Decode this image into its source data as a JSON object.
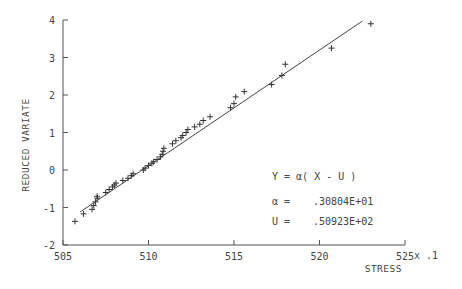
{
  "chart_data": {
    "type": "scatter",
    "title": "",
    "xlabel": "STRESS",
    "xlabel_suffix": "x .1",
    "ylabel": "REDUCED VARIATE",
    "xlim": [
      505,
      525
    ],
    "ylim": [
      -2,
      4
    ],
    "x_ticks": [
      505,
      510,
      515,
      520,
      525
    ],
    "x_tick_labels": [
      "505",
      "510",
      "515",
      "520",
      "525"
    ],
    "y_ticks": [
      -2,
      -1,
      0,
      1,
      2,
      3,
      4
    ],
    "y_tick_labels": [
      "-2",
      "-1",
      "0",
      "1",
      "2",
      "3",
      "4"
    ],
    "grid": false,
    "marker": "+",
    "series": [
      {
        "name": "observations",
        "points": [
          [
            505.7,
            -1.37
          ],
          [
            506.2,
            -1.17
          ],
          [
            506.7,
            -1.05
          ],
          [
            506.8,
            -0.95
          ],
          [
            506.9,
            -0.85
          ],
          [
            507.0,
            -0.75
          ],
          [
            507.0,
            -0.7
          ],
          [
            507.5,
            -0.6
          ],
          [
            507.7,
            -0.52
          ],
          [
            507.9,
            -0.45
          ],
          [
            508.0,
            -0.4
          ],
          [
            508.1,
            -0.35
          ],
          [
            508.5,
            -0.28
          ],
          [
            508.8,
            -0.22
          ],
          [
            509.0,
            -0.15
          ],
          [
            509.1,
            -0.1
          ],
          [
            509.7,
            0.0
          ],
          [
            509.8,
            0.05
          ],
          [
            510.0,
            0.12
          ],
          [
            510.2,
            0.18
          ],
          [
            510.3,
            0.22
          ],
          [
            510.5,
            0.28
          ],
          [
            510.7,
            0.35
          ],
          [
            510.8,
            0.42
          ],
          [
            510.85,
            0.5
          ],
          [
            510.9,
            0.58
          ],
          [
            511.4,
            0.7
          ],
          [
            511.6,
            0.78
          ],
          [
            511.9,
            0.86
          ],
          [
            512.0,
            0.92
          ],
          [
            512.2,
            1.0
          ],
          [
            512.3,
            1.08
          ],
          [
            512.7,
            1.15
          ],
          [
            513.0,
            1.22
          ],
          [
            513.2,
            1.32
          ],
          [
            513.6,
            1.42
          ],
          [
            514.8,
            1.66
          ],
          [
            515.0,
            1.77
          ],
          [
            515.1,
            1.95
          ],
          [
            515.6,
            2.09
          ],
          [
            517.2,
            2.28
          ],
          [
            517.8,
            2.52
          ],
          [
            518.0,
            2.82
          ],
          [
            520.7,
            3.25
          ],
          [
            523.0,
            3.9
          ]
        ]
      }
    ],
    "fit_line": {
      "name": "Y = a(X - U)",
      "x": [
        506.0,
        522.5
      ],
      "y": [
        -1.12,
        3.97
      ]
    },
    "annotations": {
      "equation": "Y = α( X - U )",
      "alpha_label": "α =",
      "alpha_value": ".30804E+01",
      "u_label": "U =",
      "u_value": ".50923E+02"
    },
    "legend": null
  }
}
